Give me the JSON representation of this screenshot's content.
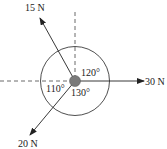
{
  "diagram": {
    "type": "force-diagram",
    "forces": [
      {
        "label": "15 N",
        "direction": "up-left"
      },
      {
        "label": "30 N",
        "direction": "right"
      },
      {
        "label": "20 N",
        "direction": "down-left"
      }
    ],
    "angles": [
      {
        "label": "120°",
        "between": "15 N and 30 N"
      },
      {
        "label": "130°",
        "between": "30 N and 20 N"
      },
      {
        "label": "110°",
        "between": "20 N and 15 N"
      }
    ],
    "colors": {
      "line": "#222222",
      "body": "#7a7a7a",
      "dashed": "#444444"
    }
  }
}
